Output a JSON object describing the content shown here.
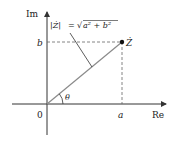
{
  "diagram": {
    "type": "complex-plane",
    "axes": {
      "x_label": "Re",
      "y_label": "Im",
      "origin_label": "0"
    },
    "point": {
      "label": "Ż",
      "x_label": "a",
      "y_label": "b"
    },
    "angle_label": "θ",
    "modulus_annotation": {
      "lhs": "|Ż|",
      "eq": "=",
      "rhs_root": "√",
      "rhs_body": "a² + b²"
    },
    "colors": {
      "axis": "#333333",
      "vector": "#8a8a8a",
      "dashed": "#666666",
      "point": "#111111"
    }
  }
}
